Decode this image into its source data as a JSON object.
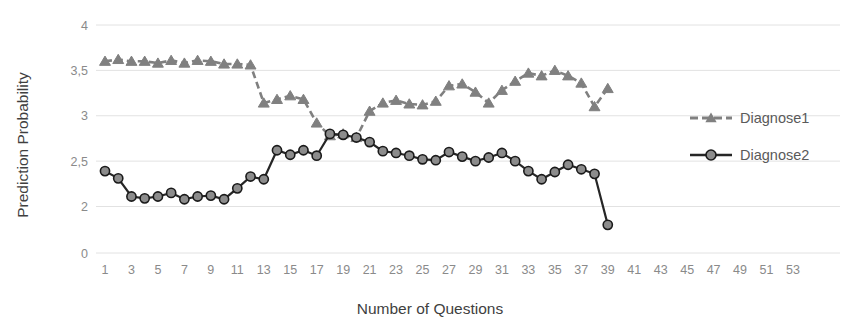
{
  "chart_data": {
    "type": "line",
    "title": "",
    "xlabel": "Number of Questions",
    "ylabel": "Prediction Probability",
    "x": [
      1,
      2,
      3,
      4,
      5,
      6,
      7,
      8,
      9,
      10,
      11,
      12,
      13,
      14,
      15,
      16,
      17,
      18,
      19,
      20,
      21,
      22,
      23,
      24,
      25,
      26,
      27,
      28,
      29,
      30,
      31,
      32,
      33,
      34,
      35,
      36,
      37,
      38,
      39
    ],
    "xlim": [
      1,
      53
    ],
    "ylim": [
      0,
      4
    ],
    "y_ticks": [
      0,
      2,
      2.5,
      3,
      3.5,
      4
    ],
    "y_tick_labels": [
      "0",
      "2",
      "2,5",
      "3",
      "3,5",
      "4"
    ],
    "x_tick_labels": [
      "1",
      "3",
      "5",
      "7",
      "9",
      "11",
      "13",
      "15",
      "17",
      "19",
      "21",
      "23",
      "25",
      "27",
      "29",
      "31",
      "33",
      "35",
      "37",
      "39",
      "41",
      "43",
      "45",
      "47",
      "49",
      "51",
      "53"
    ],
    "x_tick_values": [
      1,
      3,
      5,
      7,
      9,
      11,
      13,
      15,
      17,
      19,
      21,
      23,
      25,
      27,
      29,
      31,
      33,
      35,
      37,
      39,
      41,
      43,
      45,
      47,
      49,
      51,
      53
    ],
    "grid": true,
    "legend_position": "right",
    "series": [
      {
        "name": "Diagnose1",
        "marker": "triangle",
        "line_style": "dashed",
        "color": "#808080",
        "values": [
          3.6,
          3.62,
          3.6,
          3.6,
          3.58,
          3.61,
          3.58,
          3.61,
          3.6,
          3.57,
          3.57,
          3.56,
          3.14,
          3.18,
          3.22,
          3.18,
          2.92,
          2.78,
          2.8,
          2.76,
          3.05,
          3.14,
          3.17,
          3.13,
          3.12,
          3.16,
          3.33,
          3.35,
          3.26,
          3.14,
          3.28,
          3.38,
          3.47,
          3.44,
          3.5,
          3.44,
          3.36,
          3.1,
          3.3
        ]
      },
      {
        "name": "Diagnose2",
        "marker": "circle",
        "line_style": "solid",
        "color": "#262626",
        "values": [
          2.39,
          2.31,
          2.11,
          2.09,
          2.11,
          2.15,
          2.08,
          2.11,
          2.12,
          2.08,
          2.2,
          2.33,
          2.3,
          2.62,
          2.57,
          2.62,
          2.56,
          2.8,
          2.79,
          2.76,
          2.71,
          2.61,
          2.59,
          2.56,
          2.52,
          2.51,
          2.6,
          2.55,
          2.5,
          2.54,
          2.59,
          2.5,
          2.39,
          2.3,
          2.38,
          2.46,
          2.41,
          2.36,
          1.21
        ]
      }
    ]
  },
  "legend": {
    "items": [
      {
        "label": "Diagnose1"
      },
      {
        "label": "Diagnose2"
      }
    ]
  }
}
